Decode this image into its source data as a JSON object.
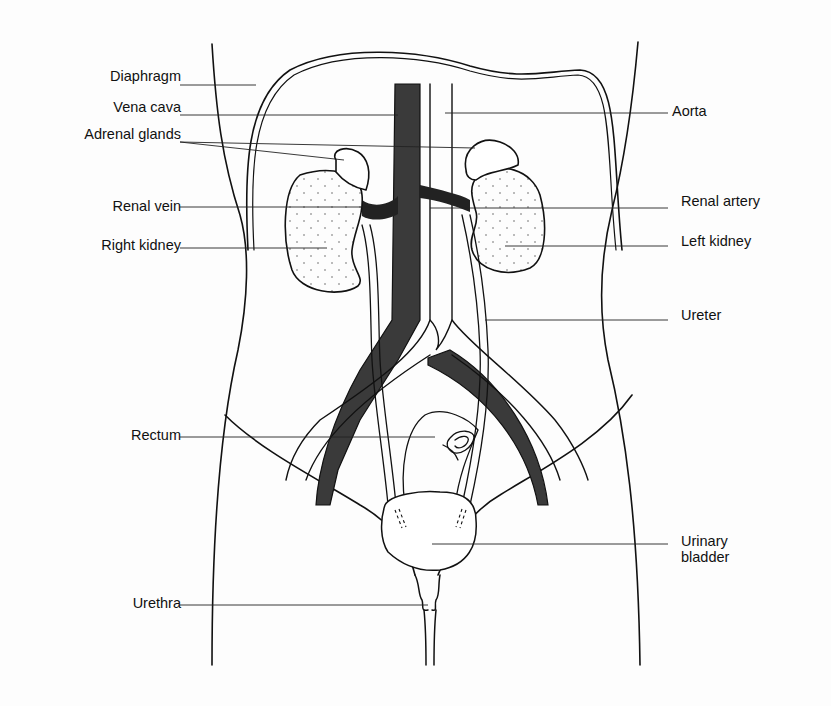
{
  "diagram": {
    "colors": {
      "ink": "#111111",
      "vein_fill": "#3a3a3a",
      "background": "#fdfdfd"
    },
    "labels_left": [
      {
        "id": "diaphragm",
        "text": "Diaphragm"
      },
      {
        "id": "vena-cava",
        "text": "Vena cava"
      },
      {
        "id": "adrenal-glands",
        "text": "Adrenal glands"
      },
      {
        "id": "renal-vein",
        "text": "Renal vein"
      },
      {
        "id": "right-kidney",
        "text": "Right kidney"
      },
      {
        "id": "rectum",
        "text": "Rectum"
      },
      {
        "id": "urethra",
        "text": "Urethra"
      }
    ],
    "labels_right": [
      {
        "id": "aorta",
        "text": "Aorta"
      },
      {
        "id": "renal-artery",
        "text": "Renal artery"
      },
      {
        "id": "left-kidney",
        "text": "Left kidney"
      },
      {
        "id": "ureter",
        "text": "Ureter"
      },
      {
        "id": "urinary-bladder",
        "text": "Urinary bladder",
        "line1": "Urinary",
        "line2": "bladder"
      }
    ]
  }
}
